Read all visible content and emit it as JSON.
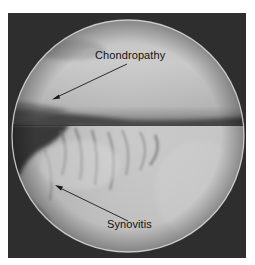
{
  "image": {
    "description": "Arthroscopic view of knee joint with annotated findings",
    "style": "grayscale",
    "annotations": [
      {
        "label": "Chondropathy",
        "target": "cartilage surface (upper region)"
      },
      {
        "label": "Synovitis",
        "target": "inflamed synovial tissue (lower-left region)"
      }
    ]
  },
  "colors": {
    "frame": "#2e2e2e",
    "text": "#111111",
    "arrow": "#1a1a1a"
  }
}
